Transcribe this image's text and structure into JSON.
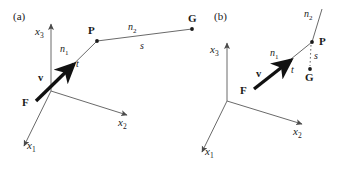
{
  "figure": {
    "width": 348,
    "height": 170,
    "background": "#ffffff",
    "line_color": "#4a4a4a",
    "bold_color": "#111111",
    "text_color": "#1a1a1a"
  },
  "panels": [
    {
      "tag": "(a)",
      "axes": {
        "x1_label": "x",
        "x1_sub": "1",
        "x2_label": "x",
        "x2_sub": "2",
        "x3_label": "x",
        "x3_sub": "3"
      },
      "points": {
        "F": "F",
        "P": "P",
        "G": "G"
      },
      "vectors": {
        "v": "v"
      },
      "segments": {
        "t": "t",
        "s": "s"
      },
      "media": {
        "n1": "n",
        "n1_sub": "1",
        "n2": "n",
        "n2_sub": "2"
      }
    },
    {
      "tag": "(b)",
      "axes": {
        "x1_label": "x",
        "x1_sub": "1",
        "x2_label": "x",
        "x2_sub": "2",
        "x3_label": "x",
        "x3_sub": "3"
      },
      "points": {
        "F": "F",
        "P": "P",
        "G": "G"
      },
      "vectors": {
        "v": "v"
      },
      "segments": {
        "t": "t",
        "s": "s"
      },
      "media": {
        "n1": "n",
        "n1_sub": "1",
        "n2": "n",
        "n2_sub": "2"
      }
    }
  ]
}
